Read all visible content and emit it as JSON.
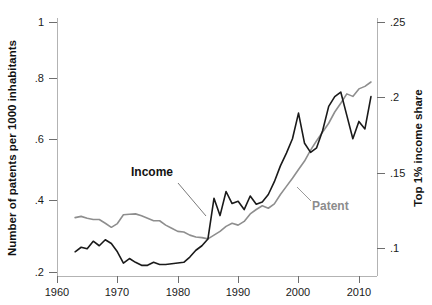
{
  "chart_data": {
    "type": "line",
    "title": "",
    "xlabel": "",
    "ylabel": "Number of patents per 1000 inhabitants",
    "y2label": "Top 1% income share",
    "xlim": [
      1960,
      2013
    ],
    "ylim": [
      0.2,
      1.0
    ],
    "y2lim": [
      0.085,
      0.255
    ],
    "grid": false,
    "legend": "inline-annotations",
    "xticks": [
      1960,
      1970,
      1980,
      1990,
      2000,
      2010
    ],
    "xticklabels": [
      "1960",
      "1970",
      "1980",
      "1990",
      "2000",
      "2010"
    ],
    "yticks": [
      0.2,
      0.4,
      0.6,
      0.8,
      1.0
    ],
    "yticklabels": [
      ".2",
      ".4",
      ".6",
      ".8",
      "1"
    ],
    "y2ticks": [
      0.1,
      0.15,
      0.2,
      0.25
    ],
    "y2ticklabels": [
      ".1",
      ".15",
      ".2",
      ".25"
    ],
    "annotations": [
      {
        "text": "Income",
        "color": "#121212",
        "x": 1972.5,
        "y": 0.545
      },
      {
        "text": "Patent",
        "color": "#8c8c8c",
        "x": 1999.0,
        "y": 0.405
      }
    ],
    "series": [
      {
        "name": "Patent",
        "axis": "left",
        "color": "#8e8e8e",
        "x": [
          1963,
          1964,
          1965,
          1966,
          1967,
          1968,
          1969,
          1970,
          1971,
          1972,
          1973,
          1974,
          1975,
          1976,
          1977,
          1978,
          1979,
          1980,
          1981,
          1982,
          1983,
          1984,
          1985,
          1986,
          1987,
          1988,
          1989,
          1990,
          1991,
          1992,
          1993,
          1994,
          1995,
          1996,
          1997,
          1998,
          1999,
          2000,
          2001,
          2002,
          2003,
          2004,
          2005,
          2006,
          2007,
          2008,
          2009,
          2010,
          2011,
          2012
        ],
        "values": [
          0.374,
          0.378,
          0.372,
          0.368,
          0.368,
          0.356,
          0.343,
          0.355,
          0.383,
          0.385,
          0.386,
          0.38,
          0.372,
          0.364,
          0.364,
          0.35,
          0.34,
          0.33,
          0.328,
          0.318,
          0.312,
          0.31,
          0.306,
          0.318,
          0.33,
          0.346,
          0.356,
          0.35,
          0.362,
          0.386,
          0.4,
          0.412,
          0.404,
          0.418,
          0.448,
          0.474,
          0.5,
          0.528,
          0.555,
          0.59,
          0.62,
          0.648,
          0.676,
          0.712,
          0.74,
          0.77,
          0.762,
          0.786,
          0.794,
          0.808
        ]
      },
      {
        "name": "Income",
        "axis": "right",
        "color": "#1a1a1a",
        "x": [
          1963,
          1964,
          1965,
          1966,
          1967,
          1968,
          1969,
          1970,
          1971,
          1972,
          1973,
          1974,
          1975,
          1976,
          1977,
          1978,
          1979,
          1980,
          1981,
          1982,
          1983,
          1984,
          1985,
          1986,
          1987,
          1988,
          1989,
          1990,
          1991,
          1992,
          1993,
          1994,
          1995,
          1996,
          1997,
          1998,
          1999,
          2000,
          2001,
          2002,
          2003,
          2004,
          2005,
          2006,
          2007,
          2008,
          2009,
          2010,
          2011,
          2012
        ],
        "values": [
          0.0975,
          0.1005,
          0.0995,
          0.1045,
          0.1015,
          0.1055,
          0.103,
          0.0975,
          0.09,
          0.093,
          0.0905,
          0.0885,
          0.0885,
          0.0905,
          0.089,
          0.089,
          0.0895,
          0.09,
          0.0905,
          0.094,
          0.0985,
          0.1015,
          0.106,
          0.133,
          0.1215,
          0.1375,
          0.1295,
          0.131,
          0.1255,
          0.1345,
          0.129,
          0.1305,
          0.1355,
          0.144,
          0.1545,
          0.163,
          0.1725,
          0.1895,
          0.1695,
          0.1635,
          0.1665,
          0.178,
          0.194,
          0.2005,
          0.2035,
          0.188,
          0.1725,
          0.184,
          0.179,
          0.2005
        ]
      }
    ]
  },
  "axes": {
    "left_title": "Number of patents per 1000 inhabitants",
    "right_title": "Top 1% income share"
  }
}
